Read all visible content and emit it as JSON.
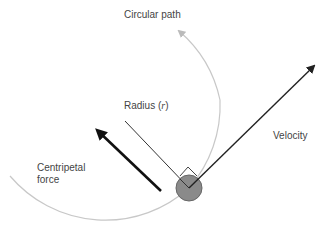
{
  "labels": {
    "circular_path": "Circular path",
    "radius": "Radius (",
    "radius_symbol": "r",
    "radius_close": ")",
    "velocity": "Velocity",
    "centripetal_line1": "Centripetal",
    "centripetal_line2": "force"
  },
  "colors": {
    "path": "#c8c8c8",
    "radius_line": "#333333",
    "velocity_arrow": "#222222",
    "force_arrow": "#111111",
    "object_fill": "#8a8a8a",
    "object_stroke": "#666666",
    "text": "#444444"
  }
}
